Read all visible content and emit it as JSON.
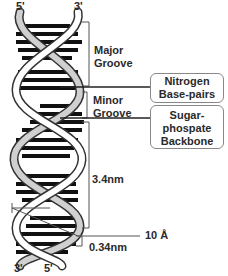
{
  "strand_ends": {
    "top_left": "5'",
    "top_right": "3'",
    "bottom_left": "3'",
    "bottom_right": "5'"
  },
  "labels": {
    "major_groove": [
      "Major",
      "Groove"
    ],
    "minor_groove": [
      "Minor",
      "Groove"
    ],
    "pitch": "3.4nm",
    "base_spacing": "0.34nm",
    "diameter": "10 Å"
  },
  "callouts": {
    "nitrogen_base_pairs": [
      "Nitrogen",
      "Base-pairs"
    ],
    "sugar_phosphate_backbone": [
      "Sugar-",
      "phospate",
      "Backbone"
    ]
  },
  "colors": {
    "stripe": "#111111",
    "backbone_light": "#d0d0d0",
    "backbone_white": "#ffffff",
    "line": "#555555"
  }
}
